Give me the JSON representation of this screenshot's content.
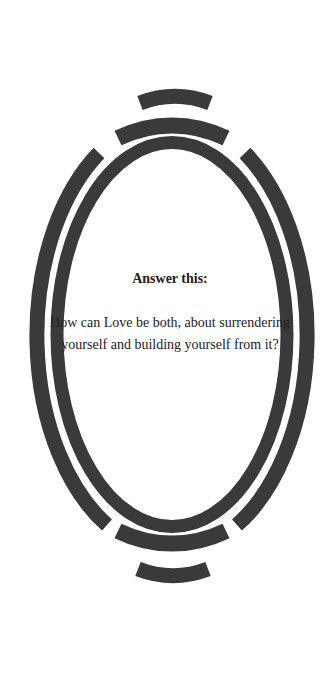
{
  "card": {
    "heading": "Answer this:",
    "question": "How can Love be both, about surrendering yourself and building yourself from it?"
  },
  "frame": {
    "icon": "ornamental-oval-frame-icon",
    "stroke_color": "#3a3a3a",
    "background_color": "#ffffff"
  }
}
